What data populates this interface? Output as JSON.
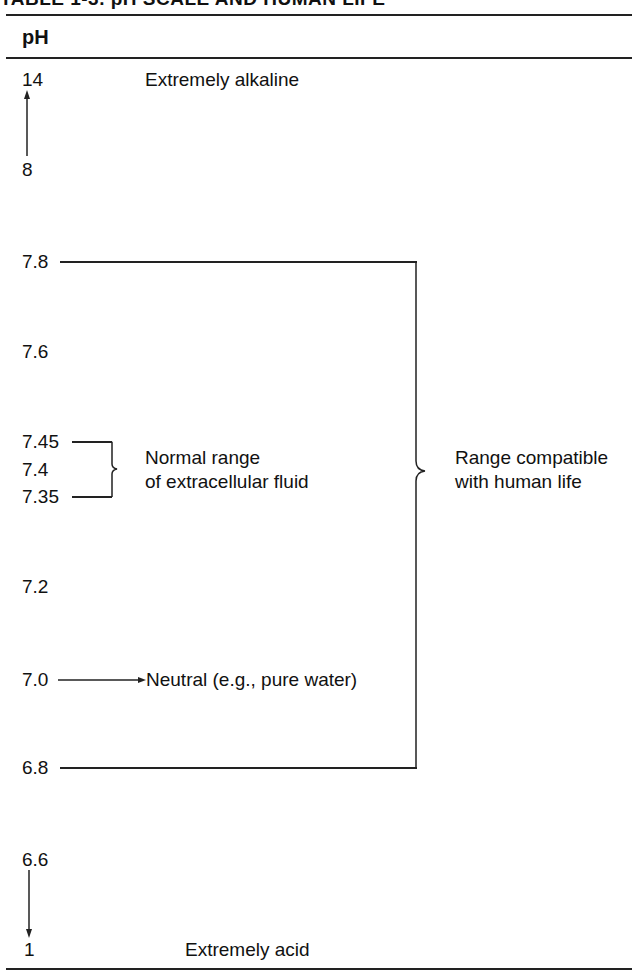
{
  "table": {
    "title": "TABLE 1-3. pH SCALE AND HUMAN LIFE",
    "column_header": "pH"
  },
  "scale": {
    "ph_14": "14",
    "ph_8": "8",
    "ph_7_8": "7.8",
    "ph_7_6": "7.6",
    "ph_7_45": "7.45",
    "ph_7_4": "7.4",
    "ph_7_35": "7.35",
    "ph_7_2": "7.2",
    "ph_7_0": "7.0",
    "ph_6_8": "6.8",
    "ph_6_6": "6.6",
    "ph_1": "1"
  },
  "annotations": {
    "alkaline": "Extremely alkaline",
    "normal_range_line1": "Normal range",
    "normal_range_line2": "of extracellular fluid",
    "neutral": "Neutral (e.g., pure water)",
    "compatible_line1": "Range compatible",
    "compatible_line2": "with human life",
    "acid": "Extremely acid"
  }
}
